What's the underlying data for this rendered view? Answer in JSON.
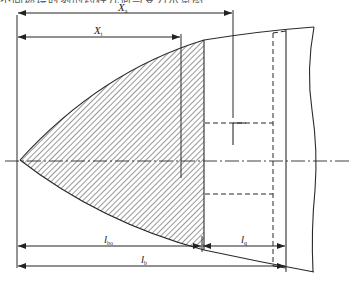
{
  "caption": "不同燃烧时刻的药柱几何与受力示意图",
  "labels": {
    "xa": {
      "main": "X",
      "sub": "a"
    },
    "xt": {
      "main": "X",
      "sub": "t"
    },
    "lbo": {
      "main": "l",
      "sub": "bo"
    },
    "lq": {
      "main": "l",
      "sub": "q"
    },
    "lb": {
      "main": "l",
      "sub": "b"
    }
  },
  "colors": {
    "line": "#2a2a2a",
    "hatch": "#444444",
    "background": "#ffffff"
  }
}
